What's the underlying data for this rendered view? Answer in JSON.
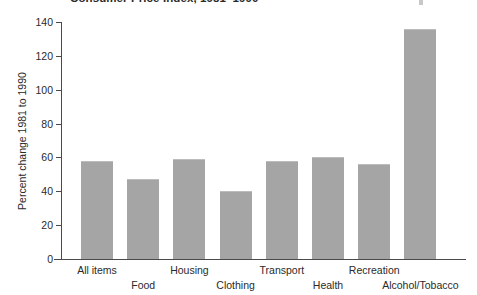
{
  "chart_data": {
    "type": "bar",
    "title": "Consumer Price Index, 1981–1990",
    "xlabel": "",
    "ylabel": "Percent change 1981 to 1990",
    "categories": [
      "All items",
      "Food",
      "Housing",
      "Clothing",
      "Transport",
      "Health",
      "Recreation",
      "Alcohol/Tobacco"
    ],
    "values": [
      58,
      47,
      59,
      40,
      58,
      60,
      56,
      136
    ],
    "ylim": [
      0,
      140
    ],
    "yticks": [
      0,
      20,
      40,
      60,
      80,
      100,
      120,
      140
    ],
    "ytick_labels": [
      "0",
      "20",
      "40",
      "60",
      "80",
      "100",
      "120",
      "140"
    ],
    "grid": false,
    "legend": false,
    "bar_color": "#a5a5a5",
    "axis_color": "#4a4a4a"
  },
  "axis": {
    "y_title": "Percent change 1981 to 1990"
  },
  "title": {
    "text": "Consumer Price Index, 1981–1990"
  }
}
